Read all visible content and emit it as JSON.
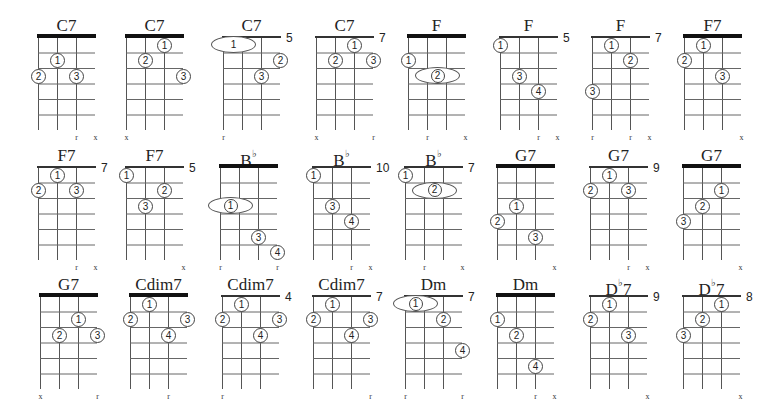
{
  "diagram": {
    "type": "chord-chart",
    "strings": 4,
    "frets_shown": 6,
    "chords": [
      {
        "name": "C7",
        "x": 38,
        "y": 37,
        "nut": true,
        "fret_label": "",
        "fingers": [
          {
            "n": "1",
            "s": 1,
            "f": 2
          },
          {
            "n": "2",
            "s": 0,
            "f": 3
          },
          {
            "n": "3",
            "s": 2,
            "f": 3
          }
        ],
        "barres": [],
        "bottom": [
          {
            "s": 2,
            "t": "r"
          },
          {
            "s": 3,
            "t": "x"
          }
        ]
      },
      {
        "name": "C7",
        "x": 126,
        "y": 37,
        "nut": true,
        "fret_label": "",
        "fingers": [
          {
            "n": "1",
            "s": 2,
            "f": 1
          },
          {
            "n": "2",
            "s": 1,
            "f": 2
          },
          {
            "n": "3",
            "s": 3,
            "f": 3
          }
        ],
        "barres": [],
        "bottom": [
          {
            "s": 0,
            "t": "x"
          }
        ]
      },
      {
        "name": "C7",
        "x": 223,
        "y": 37,
        "nut": false,
        "fret_label": "5",
        "fingers": [
          {
            "n": "2",
            "s": 3,
            "f": 2
          },
          {
            "n": "3",
            "s": 2,
            "f": 3
          }
        ],
        "barres": [
          {
            "n": "1",
            "from": 0,
            "to": 1,
            "f": 1,
            "plain": true
          }
        ],
        "bottom": [
          {
            "s": 0,
            "t": "r"
          }
        ]
      },
      {
        "name": "C7",
        "x": 316,
        "y": 37,
        "nut": false,
        "fret_label": "7",
        "fingers": [
          {
            "n": "1",
            "s": 2,
            "f": 1
          },
          {
            "n": "2",
            "s": 1,
            "f": 2
          },
          {
            "n": "3",
            "s": 3,
            "f": 2
          }
        ],
        "barres": [],
        "bottom": [
          {
            "s": 0,
            "t": "x"
          },
          {
            "s": 3,
            "t": "r"
          }
        ]
      },
      {
        "name": "F",
        "x": 408,
        "y": 37,
        "nut": true,
        "fret_label": "",
        "fingers": [
          {
            "n": "1",
            "s": 0,
            "f": 2
          }
        ],
        "barres": [
          {
            "n": "2",
            "from": 1,
            "to": 2,
            "f": 3,
            "plain": false
          }
        ],
        "bottom": [
          {
            "s": 1,
            "t": "r"
          },
          {
            "s": 3,
            "t": "x"
          }
        ]
      },
      {
        "name": "F",
        "x": 500,
        "y": 37,
        "nut": false,
        "fret_label": "5",
        "fingers": [
          {
            "n": "1",
            "s": 0,
            "f": 1
          },
          {
            "n": "3",
            "s": 1,
            "f": 3
          },
          {
            "n": "4",
            "s": 2,
            "f": 4
          }
        ],
        "barres": [],
        "bottom": [
          {
            "s": 2,
            "t": "r"
          },
          {
            "s": 3,
            "t": "x"
          }
        ]
      },
      {
        "name": "F",
        "x": 592,
        "y": 37,
        "nut": false,
        "fret_label": "7",
        "fingers": [
          {
            "n": "1",
            "s": 1,
            "f": 1
          },
          {
            "n": "2",
            "s": 2,
            "f": 2
          },
          {
            "n": "3",
            "s": 0,
            "f": 4
          }
        ],
        "barres": [],
        "bottom": [
          {
            "s": 0,
            "t": "r"
          },
          {
            "s": 2,
            "t": "r"
          },
          {
            "s": 3,
            "t": "x"
          }
        ]
      },
      {
        "name": "F7",
        "x": 684,
        "y": 37,
        "nut": true,
        "fret_label": "",
        "fingers": [
          {
            "n": "1",
            "s": 1,
            "f": 1
          },
          {
            "n": "2",
            "s": 0,
            "f": 2
          },
          {
            "n": "3",
            "s": 2,
            "f": 3
          }
        ],
        "barres": [],
        "bottom": [
          {
            "s": 3,
            "t": "x"
          }
        ]
      },
      {
        "name": "F7",
        "x": 38,
        "y": 167,
        "nut": false,
        "fret_label": "7",
        "fingers": [
          {
            "n": "1",
            "s": 1,
            "f": 1
          },
          {
            "n": "2",
            "s": 0,
            "f": 2
          },
          {
            "n": "3",
            "s": 2,
            "f": 2
          }
        ],
        "barres": [],
        "bottom": [
          {
            "s": 2,
            "t": "r"
          },
          {
            "s": 3,
            "t": "x"
          }
        ]
      },
      {
        "name": "F7",
        "x": 126,
        "y": 167,
        "nut": false,
        "fret_label": "5",
        "fingers": [
          {
            "n": "1",
            "s": 0,
            "f": 1
          },
          {
            "n": "2",
            "s": 2,
            "f": 2
          },
          {
            "n": "3",
            "s": 1,
            "f": 3
          }
        ],
        "barres": [],
        "bottom": [
          {
            "s": 3,
            "t": "x"
          }
        ]
      },
      {
        "name": "B",
        "flat": "♭",
        "x": 220,
        "y": 167,
        "nut": true,
        "fret_label": "",
        "fingers": [
          {
            "n": "3",
            "s": 2,
            "f": 5
          },
          {
            "n": "4",
            "s": 3,
            "f": 6
          }
        ],
        "barres": [
          {
            "n": "1",
            "from": 0,
            "to": 1,
            "f": 3,
            "plain": false
          }
        ],
        "bottom": [
          {
            "s": 0,
            "t": "r"
          },
          {
            "s": 3,
            "t": "r"
          }
        ]
      },
      {
        "name": "B",
        "flat": "♭",
        "x": 313,
        "y": 167,
        "nut": false,
        "fret_label": "10",
        "fingers": [
          {
            "n": "1",
            "s": 0,
            "f": 1
          },
          {
            "n": "3",
            "s": 1,
            "f": 3
          },
          {
            "n": "4",
            "s": 2,
            "f": 4
          }
        ],
        "barres": [],
        "bottom": [
          {
            "s": 2,
            "t": "r"
          },
          {
            "s": 3,
            "t": "x"
          }
        ]
      },
      {
        "name": "B",
        "flat": "♭",
        "x": 405,
        "y": 167,
        "nut": false,
        "fret_label": "7",
        "fingers": [
          {
            "n": "1",
            "s": 0,
            "f": 1
          }
        ],
        "barres": [
          {
            "n": "2",
            "from": 1,
            "to": 2,
            "f": 2,
            "plain": false
          }
        ],
        "bottom": [
          {
            "s": 1,
            "t": "r"
          },
          {
            "s": 3,
            "t": "x"
          }
        ]
      },
      {
        "name": "G7",
        "x": 497,
        "y": 167,
        "nut": true,
        "fret_label": "",
        "fingers": [
          {
            "n": "1",
            "s": 1,
            "f": 3
          },
          {
            "n": "2",
            "s": 0,
            "f": 4
          },
          {
            "n": "3",
            "s": 2,
            "f": 5
          }
        ],
        "barres": [],
        "bottom": [
          {
            "s": 3,
            "t": "x"
          }
        ]
      },
      {
        "name": "G7",
        "x": 590,
        "y": 167,
        "nut": false,
        "fret_label": "9",
        "fingers": [
          {
            "n": "1",
            "s": 1,
            "f": 1
          },
          {
            "n": "2",
            "s": 0,
            "f": 2
          },
          {
            "n": "3",
            "s": 2,
            "f": 2
          }
        ],
        "barres": [],
        "bottom": [
          {
            "s": 2,
            "t": "r"
          },
          {
            "s": 3,
            "t": "x"
          }
        ]
      },
      {
        "name": "G7",
        "x": 683,
        "y": 167,
        "nut": true,
        "fret_label": "",
        "fingers": [
          {
            "n": "1",
            "s": 2,
            "f": 2
          },
          {
            "n": "2",
            "s": 1,
            "f": 3
          },
          {
            "n": "3",
            "s": 0,
            "f": 4
          }
        ],
        "barres": [],
        "bottom": [
          {
            "s": 3,
            "t": "x"
          }
        ]
      },
      {
        "name": "G7",
        "x": 40,
        "y": 296,
        "nut": true,
        "fret_label": "",
        "fingers": [
          {
            "n": "1",
            "s": 2,
            "f": 2
          },
          {
            "n": "2",
            "s": 1,
            "f": 3
          },
          {
            "n": "3",
            "s": 3,
            "f": 3
          }
        ],
        "barres": [],
        "bottom": [
          {
            "s": 0,
            "t": "x"
          },
          {
            "s": 3,
            "t": "r"
          }
        ]
      },
      {
        "name": "Cdim7",
        "x": 130,
        "y": 296,
        "nut": true,
        "fret_label": "",
        "fingers": [
          {
            "n": "1",
            "s": 1,
            "f": 1
          },
          {
            "n": "2",
            "s": 0,
            "f": 2
          },
          {
            "n": "3",
            "s": 3,
            "f": 2
          },
          {
            "n": "4",
            "s": 2,
            "f": 3
          }
        ],
        "barres": [],
        "bottom": [
          {
            "s": 2,
            "t": "r"
          }
        ]
      },
      {
        "name": "Cdim7",
        "x": 222,
        "y": 296,
        "nut": false,
        "fret_label": "4",
        "fingers": [
          {
            "n": "1",
            "s": 1,
            "f": 1
          },
          {
            "n": "2",
            "s": 0,
            "f": 2
          },
          {
            "n": "3",
            "s": 3,
            "f": 2
          },
          {
            "n": "4",
            "s": 2,
            "f": 3
          }
        ],
        "barres": [],
        "bottom": [
          {
            "s": 0,
            "t": "r"
          }
        ]
      },
      {
        "name": "Cdim7",
        "x": 313,
        "y": 296,
        "nut": false,
        "fret_label": "7",
        "fingers": [
          {
            "n": "1",
            "s": 1,
            "f": 1
          },
          {
            "n": "2",
            "s": 0,
            "f": 2
          },
          {
            "n": "3",
            "s": 3,
            "f": 2
          },
          {
            "n": "4",
            "s": 2,
            "f": 3
          }
        ],
        "barres": [],
        "bottom": [
          {
            "s": 3,
            "t": "r"
          }
        ]
      },
      {
        "name": "Dm",
        "x": 405,
        "y": 296,
        "nut": false,
        "fret_label": "7",
        "fingers": [
          {
            "n": "2",
            "s": 2,
            "f": 2
          },
          {
            "n": "4",
            "s": 3,
            "f": 4
          }
        ],
        "barres": [
          {
            "n": "1",
            "from": 0,
            "to": 1,
            "f": 1,
            "plain": false
          }
        ],
        "bottom": [
          {
            "s": 0,
            "t": "r"
          },
          {
            "s": 3,
            "t": "r"
          }
        ]
      },
      {
        "name": "Dm",
        "x": 497,
        "y": 296,
        "nut": true,
        "fret_label": "",
        "fingers": [
          {
            "n": "1",
            "s": 0,
            "f": 2
          },
          {
            "n": "2",
            "s": 1,
            "f": 3
          },
          {
            "n": "4",
            "s": 2,
            "f": 5
          }
        ],
        "barres": [],
        "bottom": [
          {
            "s": 2,
            "t": "r"
          },
          {
            "s": 3,
            "t": "x"
          }
        ]
      },
      {
        "name": "D",
        "flat": "♭",
        "suffix": "7",
        "x": 590,
        "y": 296,
        "nut": false,
        "fret_label": "9",
        "fingers": [
          {
            "n": "1",
            "s": 1,
            "f": 1
          },
          {
            "n": "2",
            "s": 0,
            "f": 2
          },
          {
            "n": "3",
            "s": 2,
            "f": 3
          }
        ],
        "barres": [],
        "bottom": [
          {
            "s": 3,
            "t": "x"
          }
        ]
      },
      {
        "name": "D",
        "flat": "♭",
        "suffix": "7",
        "x": 683,
        "y": 296,
        "nut": false,
        "fret_label": "8",
        "fingers": [
          {
            "n": "1",
            "s": 2,
            "f": 1
          },
          {
            "n": "2",
            "s": 1,
            "f": 2
          },
          {
            "n": "3",
            "s": 0,
            "f": 3
          }
        ],
        "barres": [],
        "bottom": [
          {
            "s": 3,
            "t": "x"
          }
        ]
      }
    ]
  },
  "finger_glyphs": {
    "1": "①",
    "2": "②",
    "3": "③",
    "4": "④"
  },
  "colors": {
    "ink": "#1a1a1a",
    "background": "#ffffff",
    "nut": "#111111"
  }
}
